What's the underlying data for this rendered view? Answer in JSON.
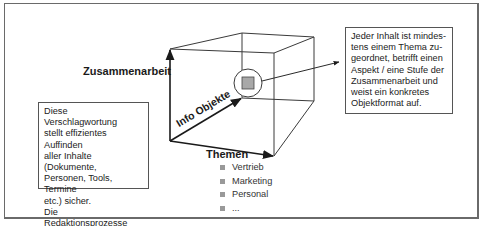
{
  "diagram": {
    "axes": {
      "vertical": "Zusammenarbeit",
      "depth": "Info Objekte",
      "horizontal": "Themen"
    },
    "topics": [
      "Vertrieb",
      "Marketing",
      "Personal",
      "..."
    ],
    "left_note": {
      "lines": [
        "Diese Verschlagwortung",
        "stellt effizientes Auffinden",
        "aller Inhalte (Dokumente,",
        "Personen, Tools, Termine",
        "etc.) sicher.",
        "Die Redaktionsprozesse",
        "müssen dies abbilden."
      ]
    },
    "right_note": {
      "lines": [
        "Jeder Inhalt ist mindes-",
        "tens einem Thema zu-",
        "geordnet, betrifft einen",
        "Aspekt / eine Stufe der",
        "Zusammenarbeit und",
        "weist ein konkretes",
        "Objektformat auf."
      ]
    },
    "colors": {
      "line": "#333333",
      "frame": "#6a6a6a",
      "object_fill": "#a8a8a8",
      "bullet": "#999999"
    }
  }
}
